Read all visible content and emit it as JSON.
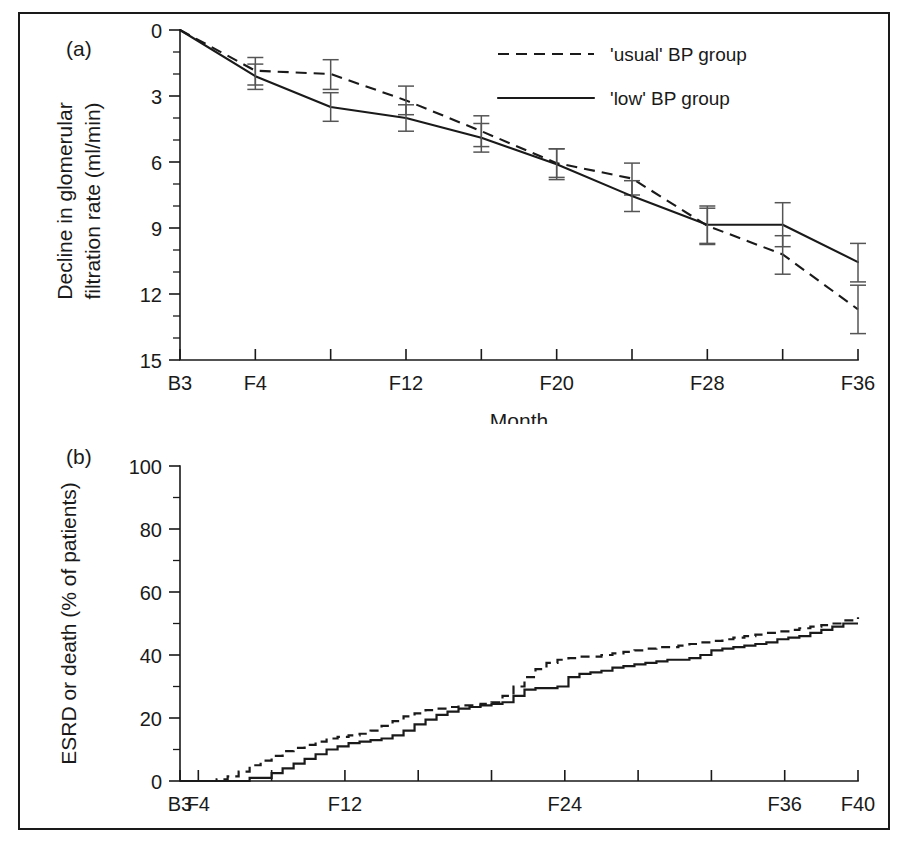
{
  "figure": {
    "background": "#ffffff",
    "ink": "#1a1a1a",
    "errorbar_color": "#555555",
    "panel_a_tag": "(a)",
    "panel_b_tag": "(b)"
  },
  "legend": {
    "position": "top-right-of-panel-a",
    "entries": [
      {
        "label": "'usual' BP group",
        "style": "dashed"
      },
      {
        "label": "'low' BP group",
        "style": "solid"
      }
    ]
  },
  "chart_data": [
    {
      "id": "panel-a",
      "type": "line",
      "title": "",
      "panel_tag": "(a)",
      "xlabel": "Month",
      "ylabel": "Decline in glomerular filtration rate (ml/min)",
      "ylabel_line1": "Decline in glomerular",
      "ylabel_line2": "filtration rate (ml/min)",
      "y_inverted": true,
      "ylim": [
        0,
        15
      ],
      "y_major_ticks": [
        0,
        3,
        6,
        9,
        12,
        15
      ],
      "y_major_ticklabels": [
        "0",
        "3",
        "6",
        "9",
        "12",
        "15"
      ],
      "y_minor_step": 1,
      "grid": false,
      "x_index_range": [
        0,
        9
      ],
      "x_tick_indices": [
        0,
        1,
        2,
        3,
        4,
        5,
        6,
        7,
        8,
        9
      ],
      "x_ticklabels": [
        "B3",
        "F4",
        "",
        "F12",
        "",
        "F20",
        "",
        "F28",
        "",
        "F36"
      ],
      "x_tick_months": [
        "B3",
        "F4",
        "F8",
        "F12",
        "F16",
        "F20",
        "F24",
        "F28",
        "F32",
        "F36"
      ],
      "series": [
        {
          "name": "'usual' BP group",
          "style": "dashed",
          "x": [
            0,
            1,
            2,
            3,
            4,
            5,
            6,
            7,
            8,
            9
          ],
          "values": [
            0.0,
            1.85,
            2.0,
            3.2,
            4.6,
            6.05,
            6.75,
            8.9,
            10.2,
            12.7
          ],
          "err_low": [
            0.0,
            1.25,
            1.35,
            2.55,
            3.9,
            5.4,
            6.05,
            8.1,
            9.35,
            11.6
          ],
          "err_high": [
            0.0,
            2.5,
            2.7,
            3.85,
            5.3,
            6.7,
            7.5,
            9.75,
            11.1,
            13.8
          ]
        },
        {
          "name": "'low' BP group",
          "style": "solid",
          "x": [
            0,
            1,
            2,
            3,
            4,
            5,
            6,
            7,
            8,
            9
          ],
          "values": [
            0.0,
            2.1,
            3.5,
            4.0,
            4.9,
            6.1,
            7.55,
            8.85,
            8.85,
            10.55
          ],
          "err_low": [
            0.0,
            1.55,
            2.85,
            3.4,
            4.25,
            5.4,
            6.85,
            8.0,
            7.85,
            9.7
          ],
          "err_high": [
            0.0,
            2.7,
            4.15,
            4.6,
            5.55,
            6.8,
            8.25,
            9.7,
            9.85,
            11.45
          ]
        }
      ]
    },
    {
      "id": "panel-b",
      "type": "line",
      "subtype": "step",
      "title": "",
      "panel_tag": "(b)",
      "xlabel": "Month",
      "ylabel": "ESRD or death (% of patients)",
      "ylim": [
        0,
        100
      ],
      "y_major_ticks": [
        0,
        20,
        40,
        60,
        80,
        100
      ],
      "y_major_ticklabels": [
        "0",
        "20",
        "40",
        "60",
        "80",
        "100"
      ],
      "y_minor_step": 10,
      "grid": false,
      "xlim": [
        3,
        40
      ],
      "x_major_ticks": [
        3,
        4,
        8,
        12,
        16,
        20,
        24,
        28,
        32,
        36,
        40
      ],
      "x_ticklabels": [
        "B3",
        "F4",
        "",
        "F12",
        "",
        "",
        "F24",
        "",
        "",
        "F36",
        "F40"
      ],
      "series": [
        {
          "name": "'usual' BP group",
          "style": "dashed",
          "x": [
            3,
            4,
            5,
            5.6,
            6.2,
            6.8,
            7.4,
            8,
            8.6,
            9.2,
            9.8,
            10.4,
            11,
            11.6,
            12.2,
            12.8,
            13.4,
            14,
            14.6,
            15.2,
            15.8,
            16.4,
            17,
            17.6,
            18.2,
            18.8,
            19.4,
            20,
            20.6,
            21.2,
            21.8,
            22.4,
            23,
            23.6,
            24.2,
            24.8,
            25.4,
            26,
            26.6,
            27.2,
            27.8,
            28.4,
            29,
            29.6,
            30.2,
            30.8,
            31.4,
            32,
            32.6,
            33.2,
            33.8,
            34.4,
            35,
            35.6,
            36.2,
            36.8,
            37.4,
            38,
            38.6,
            39.2,
            40
          ],
          "values": [
            0,
            0,
            0.5,
            1.5,
            3,
            5,
            6.5,
            8,
            9.5,
            10.5,
            11.5,
            12.5,
            13.5,
            14,
            14.5,
            15,
            16,
            17.5,
            19,
            20.5,
            21.5,
            22.5,
            23,
            23.5,
            24,
            24,
            24.5,
            25,
            27,
            30,
            33,
            35.5,
            37.5,
            38.5,
            39,
            39.5,
            39.5,
            40,
            40.5,
            41,
            41.5,
            42,
            42.5,
            42.5,
            43,
            43.5,
            44,
            44.5,
            45,
            45.5,
            46,
            46.5,
            47,
            47.5,
            48,
            48.5,
            49,
            49.5,
            50,
            51,
            52
          ]
        },
        {
          "name": "'low' BP group",
          "style": "solid",
          "x": [
            3,
            4,
            5,
            5.6,
            6.2,
            6.8,
            7.4,
            8,
            8.6,
            9.2,
            9.8,
            10.4,
            11,
            11.6,
            12.2,
            12.8,
            13.4,
            14,
            14.6,
            15.2,
            15.8,
            16.4,
            17,
            17.6,
            18.2,
            18.8,
            19.4,
            20,
            20.6,
            21.2,
            21.8,
            22.4,
            23,
            23.6,
            24.2,
            24.8,
            25.4,
            26,
            26.6,
            27.2,
            27.8,
            28.4,
            29,
            29.6,
            30.2,
            30.8,
            31.4,
            32,
            32.6,
            33.2,
            33.8,
            34.4,
            35,
            35.6,
            36.2,
            36.8,
            37.4,
            38,
            38.6,
            39.2,
            40
          ],
          "values": [
            0,
            0,
            0,
            0,
            0,
            1,
            1,
            2.5,
            4,
            5.5,
            7,
            8.5,
            10,
            11,
            12,
            12.5,
            13,
            13.5,
            14.5,
            16,
            18,
            19.5,
            21,
            22,
            23,
            23.5,
            24,
            24.5,
            25,
            27,
            29,
            29.5,
            29.5,
            30,
            33,
            34,
            34.5,
            35,
            36,
            36.5,
            37,
            37.5,
            38,
            38.5,
            38.5,
            39,
            40,
            41.5,
            42,
            42.5,
            43,
            43.5,
            44,
            45,
            45.5,
            46,
            47,
            48,
            49,
            50,
            50
          ]
        }
      ]
    }
  ]
}
